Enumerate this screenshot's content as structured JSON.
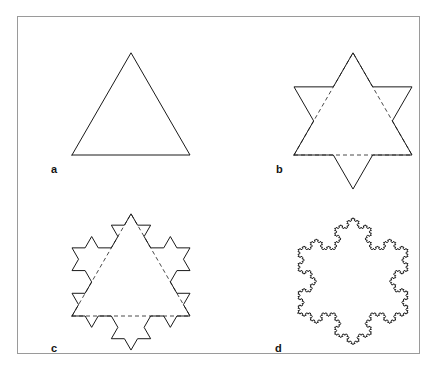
{
  "figure": {
    "frame": {
      "stroke_color": "#9a9a9a",
      "background": "#ffffff",
      "x": 17,
      "y": 16,
      "width": 403,
      "height": 338
    },
    "stroke_color": "#1a1a1a",
    "stroke_width": 1,
    "dash_color": "#4a4a4a",
    "dash_pattern": "4 3",
    "panels": [
      {
        "id": "a",
        "label": "a",
        "caption": "Equilateral triangle (initiator)",
        "iteration": 0,
        "show_dashed_initiator": false,
        "shape": "koch-snowflake",
        "size": 118,
        "origin_x": 24,
        "origin_y": 116,
        "view_w": 160,
        "view_h": 126
      },
      {
        "id": "b",
        "label": "b",
        "caption": "Star of David (first Koch iteration)",
        "iteration": 1,
        "show_dashed_initiator": true,
        "shape": "koch-snowflake",
        "size": 118,
        "origin_x": 24,
        "origin_y": 116,
        "view_w": 160,
        "view_h": 158
      },
      {
        "id": "c",
        "label": "c",
        "caption": "Second Koch iteration",
        "iteration": 2,
        "show_dashed_initiator": true,
        "shape": "koch-snowflake",
        "size": 118,
        "origin_x": 24,
        "origin_y": 111,
        "view_w": 160,
        "view_h": 148
      },
      {
        "id": "d",
        "label": "d",
        "caption": "Koch snowflake (limit curve)",
        "iteration": 4,
        "show_dashed_initiator": false,
        "shape": "koch-snowflake",
        "size": 110,
        "origin_x": 28,
        "origin_y": 108,
        "view_w": 160,
        "view_h": 148
      }
    ]
  }
}
